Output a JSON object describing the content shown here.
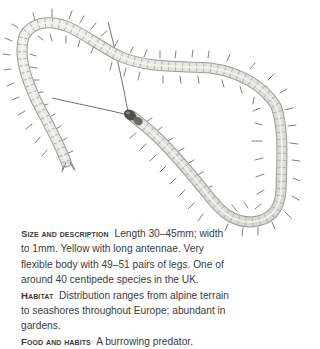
{
  "illustration": {
    "subject": "centipede",
    "alt": "Illustration of a long, pale yellow centipede with many legs and long antennae, body looped in a curving shape",
    "colors": {
      "body_fill": "#e6e6e2",
      "body_stroke": "#9a9a96",
      "segment_line": "#b4b4b0",
      "leg": "#7c7c78",
      "head": "#4e4e4a",
      "antenna": "#6e6e6a"
    }
  },
  "entry": {
    "sections": [
      {
        "heading": "Size and description",
        "text": "Length 30–45mm; width to 1mm. Yellow with long antennae. Very flexible body with 49–51 pairs of legs. One of around 40 centipede species in the UK."
      },
      {
        "heading": "Habitat",
        "text": "Distribution ranges from alpine terrain to seashores throughout Europe; abundant in gardens."
      },
      {
        "heading": "Food and habits",
        "text": "A burrowing predator."
      }
    ]
  }
}
